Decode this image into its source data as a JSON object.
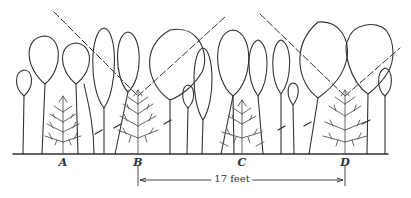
{
  "diagram": {
    "labels": [
      {
        "id": "A",
        "text": "A",
        "x": 63
      },
      {
        "id": "B",
        "text": "B",
        "x": 138
      },
      {
        "id": "C",
        "text": "C",
        "x": 242
      },
      {
        "id": "D",
        "text": "D",
        "x": 345
      }
    ],
    "dimension": {
      "text": "17 feet",
      "from": "B",
      "to": "D"
    },
    "colors": {
      "line": "#333333",
      "sapling": "#555555",
      "background": "#ffffff"
    }
  }
}
